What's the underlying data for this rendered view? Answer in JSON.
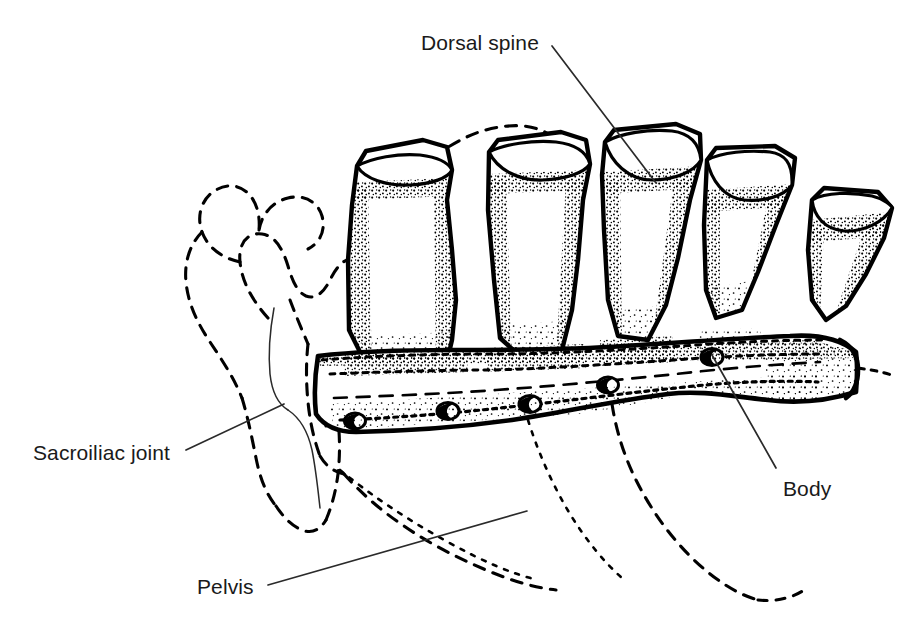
{
  "figure": {
    "background_color": "#ffffff",
    "ink_color": "#000000",
    "text_color": "#1a1a1a",
    "width": 906,
    "height": 626
  },
  "labels": [
    {
      "id": "dorsal-spine",
      "text": "Dorsal spine",
      "x": 421,
      "y": 32,
      "leader": {
        "from_x": 552,
        "from_y": 46,
        "to_x": 656,
        "to_y": 183
      }
    },
    {
      "id": "sacroiliac-joint",
      "text": "Sacroiliac joint",
      "x": 33,
      "y": 442,
      "leader": {
        "from_x": 186,
        "from_y": 450,
        "to_x": 284,
        "to_y": 404
      }
    },
    {
      "id": "body",
      "text": "Body",
      "x": 783,
      "y": 478,
      "leader": {
        "from_x": 776,
        "from_y": 468,
        "to_x": 712,
        "to_y": 355
      }
    },
    {
      "id": "pelvis",
      "text": "Pelvis",
      "x": 197,
      "y": 576,
      "leader": {
        "from_x": 268,
        "from_y": 585,
        "to_x": 527,
        "to_y": 511
      }
    }
  ],
  "anatomy": {
    "dorsal_spines": {
      "count": 5,
      "line_style": "solid-with-stipple-shading",
      "description": "Five cut dorsal (sacral) spines projecting upward from the sacral body, each with an elliptical cut surface at the tip"
    },
    "body": {
      "name": "Body",
      "line_style": "solid-with-stipple-shading",
      "foramina_count": 4,
      "description": "Sloping sacral body (centrum) with a row of dorsal sacral foramina along its lower margin"
    },
    "pelvis": {
      "name": "Pelvis",
      "line_style": "dashed",
      "description": "Pelvic outline drawn as a hidden (dashed) contour, the ilium on the left and an arc crossing over the first dorsal spine"
    },
    "sacroiliac_joint": {
      "name": "Sacroiliac joint",
      "line_style": "thin-solid",
      "description": "Thin solid line marking the articulation between the sacrum and the ilium"
    }
  }
}
